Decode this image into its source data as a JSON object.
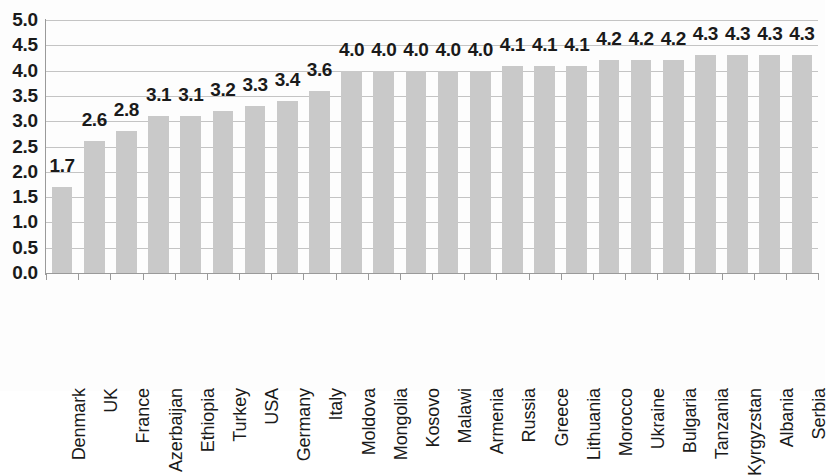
{
  "chart_data": {
    "type": "bar",
    "title": "",
    "subtitle": "",
    "xlabel": "",
    "ylabel": "",
    "ylim": [
      0.0,
      5.0
    ],
    "y_tick_step": 0.5,
    "grid": true,
    "legend": false,
    "legend_position": "none",
    "orientation": "vertical",
    "bar_color": "#c9c9c9",
    "data_label_color": "#1a1a1a",
    "gridline_color": "#c4c4c4",
    "axis_color": "#9a9a9a",
    "y_ticks": [
      "5.0",
      "4.5",
      "4.0",
      "3.5",
      "3.0",
      "2.5",
      "2.0",
      "1.5",
      "1.0",
      "0.5",
      "0.0"
    ],
    "y_tick_values": [
      5.0,
      4.5,
      4.0,
      3.5,
      3.0,
      2.5,
      2.0,
      1.5,
      1.0,
      0.5,
      0.0
    ],
    "categories": [
      "Denmark",
      "UK",
      "France",
      "Azerbaijan",
      "Ethiopia",
      "Turkey",
      "USA",
      "Germany",
      "Italy",
      "Moldova",
      "Mongolia",
      "Kosovo",
      "Malawi",
      "Armenia",
      "Russia",
      "Greece",
      "Lithuania",
      "Morocco",
      "Ukraine",
      "Bulgaria",
      "Tanzania",
      "Kyrgyzstan",
      "Albania",
      "Serbia"
    ],
    "values": [
      1.7,
      2.6,
      2.8,
      3.1,
      3.1,
      3.2,
      3.3,
      3.4,
      3.6,
      4.0,
      4.0,
      4.0,
      4.0,
      4.0,
      4.1,
      4.1,
      4.1,
      4.2,
      4.2,
      4.2,
      4.3,
      4.3,
      4.3,
      4.3
    ],
    "data_labels": [
      "1.7",
      "2.6",
      "2.8",
      "3.1",
      "3.1",
      "3.2",
      "3.3",
      "3.4",
      "3.6",
      "4.0",
      "4.0",
      "4.0",
      "4.0",
      "4.0",
      "4.1",
      "4.1",
      "4.1",
      "4.2",
      "4.2",
      "4.2",
      "4.3",
      "4.3",
      "4.3",
      "4.3"
    ]
  }
}
